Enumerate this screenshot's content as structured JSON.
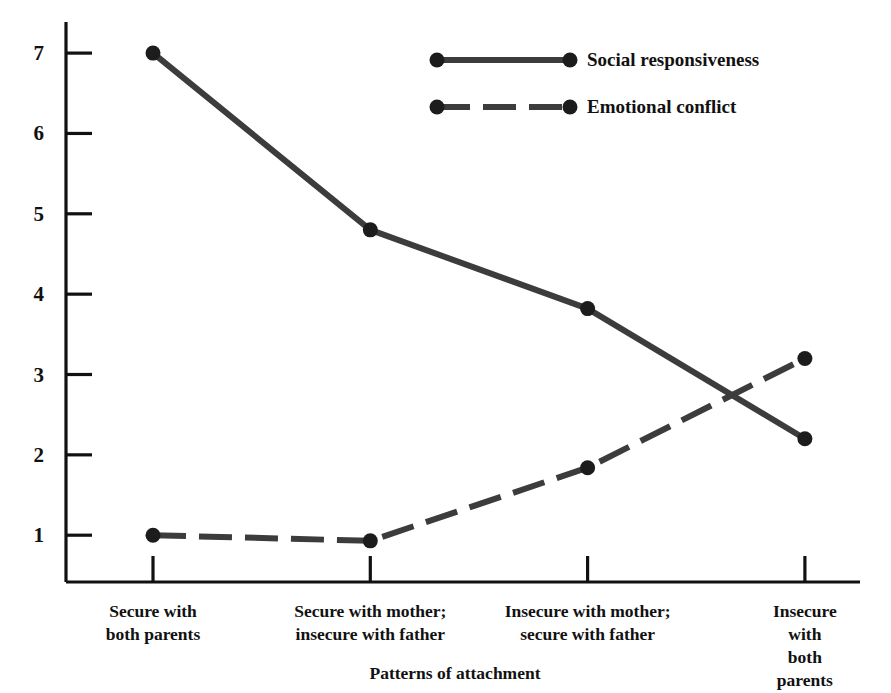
{
  "chart_data": {
    "type": "line",
    "title": "",
    "xlabel": "Patterns of attachment",
    "ylabel": "",
    "categories": [
      "Secure with\nboth parents",
      "Secure with mother;\ninsecure with father",
      "Insecure with mother;\nsecure with father",
      "Insecure with\nboth parents"
    ],
    "yticks": [
      "1",
      "2",
      "3",
      "4",
      "5",
      "6",
      "7"
    ],
    "ylim": [
      0.5,
      7.4
    ],
    "grid": false,
    "legend_position": "top-center",
    "series": [
      {
        "name": "Social responsiveness",
        "style": "solid",
        "color": "#3c3c3c",
        "marker": "circle",
        "values": [
          7.0,
          4.8,
          3.82,
          2.2
        ]
      },
      {
        "name": "Emotional conflict",
        "style": "dashed",
        "color": "#3c3c3c",
        "marker": "circle",
        "values": [
          1.0,
          0.93,
          1.84,
          3.2
        ]
      }
    ]
  },
  "axes": {
    "axis_color": "#111111",
    "tick_color": "#111111"
  }
}
